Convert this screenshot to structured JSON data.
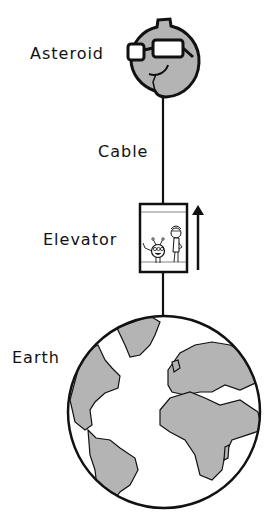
{
  "labels": {
    "asteroid": "Asteroid",
    "cable": "Cable",
    "elevator": "Elevator",
    "earth": "Earth"
  },
  "colors": {
    "line": "#111111",
    "fill_gray": "#b4b4b4",
    "background": "#ffffff"
  },
  "icons": {
    "asteroid": "asteroid-with-sunglasses-icon",
    "elevator": "elevator-car-icon",
    "arrow": "up-arrow-icon",
    "earth": "earth-globe-icon"
  }
}
